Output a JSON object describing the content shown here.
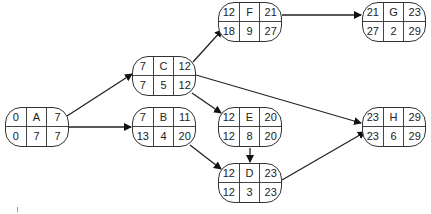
{
  "diagram": {
    "type": "activity-on-node network",
    "nodes": [
      {
        "id": "A",
        "es": "0",
        "label": "A",
        "ef": "7",
        "ls": "0",
        "dur": "7",
        "lf": "7"
      },
      {
        "id": "C",
        "es": "7",
        "label": "C",
        "ef": "12",
        "ls": "7",
        "dur": "5",
        "lf": "12"
      },
      {
        "id": "B",
        "es": "7",
        "label": "B",
        "ef": "11",
        "ls": "13",
        "dur": "4",
        "lf": "20"
      },
      {
        "id": "F",
        "es": "12",
        "label": "F",
        "ef": "21",
        "ls": "18",
        "dur": "9",
        "lf": "27"
      },
      {
        "id": "G",
        "es": "21",
        "label": "G",
        "ef": "23",
        "ls": "27",
        "dur": "2",
        "lf": "29"
      },
      {
        "id": "E",
        "es": "12",
        "label": "E",
        "ef": "20",
        "ls": "12",
        "dur": "8",
        "lf": "20"
      },
      {
        "id": "D",
        "es": "12",
        "label": "D",
        "ef": "23",
        "ls": "12",
        "dur": "3",
        "lf": "23"
      },
      {
        "id": "H",
        "es": "23",
        "label": "H",
        "ef": "29",
        "ls": "23",
        "dur": "6",
        "lf": "29"
      }
    ],
    "edges": [
      {
        "from": "A",
        "to": "C"
      },
      {
        "from": "A",
        "to": "B"
      },
      {
        "from": "C",
        "to": "F"
      },
      {
        "from": "C",
        "to": "E"
      },
      {
        "from": "C",
        "to": "H"
      },
      {
        "from": "B",
        "to": "D"
      },
      {
        "from": "E",
        "to": "D"
      },
      {
        "from": "F",
        "to": "G"
      },
      {
        "from": "D",
        "to": "H"
      }
    ],
    "colors": {
      "line": "#222222",
      "border": "#333333",
      "background": "#ffffff"
    }
  }
}
